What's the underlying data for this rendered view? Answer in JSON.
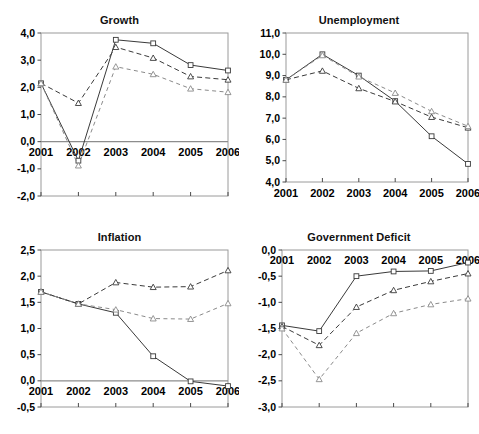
{
  "figure": {
    "panels": [
      "growth",
      "unemployment",
      "inflation",
      "deficit"
    ]
  },
  "chart_data": [
    {
      "id": "growth",
      "type": "line",
      "title": "Growth",
      "xlabel": "",
      "ylabel": "",
      "x": [
        "2001",
        "2002",
        "2003",
        "2004",
        "2005",
        "2006"
      ],
      "xticklabels": [
        "2001",
        "2002",
        "2003",
        "2004",
        "2005",
        "2006"
      ],
      "yticklabels": [
        "4,0",
        "3,0",
        "2,0",
        "1,0",
        "0,0",
        "-1,0",
        "-2,0"
      ],
      "yticks": [
        4.0,
        3.0,
        2.0,
        1.0,
        0.0,
        -1.0,
        -2.0
      ],
      "ylim": [
        -2.0,
        4.0
      ],
      "grid": false,
      "legend": "none",
      "zero_line": true,
      "series": [
        {
          "name": "series-1",
          "style": "solid",
          "marker": "square",
          "values": [
            2.15,
            -0.7,
            3.75,
            3.62,
            2.82,
            2.62
          ]
        },
        {
          "name": "series-2",
          "style": "dashed",
          "marker": "triangle",
          "values": [
            2.15,
            1.42,
            3.48,
            3.08,
            2.4,
            2.28
          ]
        },
        {
          "name": "series-3",
          "style": "dashed-light",
          "marker": "triangle",
          "values": [
            2.15,
            -0.88,
            2.76,
            2.48,
            1.95,
            1.82
          ]
        }
      ]
    },
    {
      "id": "unemployment",
      "type": "line",
      "title": "Unemployment",
      "xlabel": "",
      "ylabel": "",
      "x": [
        "2001",
        "2002",
        "2003",
        "2004",
        "2005",
        "2006"
      ],
      "xticklabels": [
        "2001",
        "2002",
        "2003",
        "2004",
        "2005",
        "2006"
      ],
      "yticklabels": [
        "11,0",
        "10,0",
        "9,0",
        "8,0",
        "7,0",
        "6,0",
        "5,0",
        "4,0"
      ],
      "yticks": [
        11.0,
        10.0,
        9.0,
        8.0,
        7.0,
        6.0,
        5.0,
        4.0
      ],
      "ylim": [
        4.0,
        11.0
      ],
      "grid": false,
      "legend": "none",
      "zero_line": false,
      "series": [
        {
          "name": "series-1",
          "style": "solid",
          "marker": "square",
          "values": [
            8.8,
            10.0,
            9.0,
            7.8,
            6.15,
            4.85
          ]
        },
        {
          "name": "series-2",
          "style": "dashed",
          "marker": "triangle",
          "values": [
            8.8,
            9.22,
            8.4,
            7.78,
            7.05,
            6.55
          ]
        },
        {
          "name": "series-3",
          "style": "dashed-light",
          "marker": "triangle",
          "values": [
            8.8,
            9.95,
            8.95,
            8.18,
            7.32,
            6.62
          ]
        }
      ]
    },
    {
      "id": "inflation",
      "type": "line",
      "title": "Inflation",
      "xlabel": "",
      "ylabel": "",
      "x": [
        "2001",
        "2002",
        "2003",
        "2004",
        "2005",
        "2006"
      ],
      "xticklabels": [
        "2001",
        "2002",
        "2003",
        "2004",
        "2005",
        "2006"
      ],
      "yticklabels": [
        "2,5",
        "2,0",
        "1,5",
        "1,0",
        "0,5",
        "0,0",
        "-0,5"
      ],
      "yticks": [
        2.5,
        2.0,
        1.5,
        1.0,
        0.5,
        0.0,
        -0.5
      ],
      "ylim": [
        -0.5,
        2.5
      ],
      "grid": false,
      "legend": "none",
      "zero_line": true,
      "series": [
        {
          "name": "series-1",
          "style": "solid",
          "marker": "square",
          "values": [
            1.7,
            1.47,
            1.3,
            0.47,
            -0.01,
            -0.1
          ]
        },
        {
          "name": "series-2",
          "style": "dashed",
          "marker": "triangle",
          "values": [
            1.7,
            1.47,
            1.88,
            1.79,
            1.8,
            2.11
          ]
        },
        {
          "name": "series-3",
          "style": "dashed-light",
          "marker": "triangle",
          "values": [
            1.7,
            1.47,
            1.36,
            1.19,
            1.18,
            1.48
          ]
        }
      ]
    },
    {
      "id": "deficit",
      "type": "line",
      "title": "Government Deficit",
      "xlabel": "",
      "ylabel": "",
      "x": [
        "2001",
        "2002",
        "2003",
        "2004",
        "2005",
        "2006"
      ],
      "xticklabels": [
        "2001",
        "2002",
        "2003",
        "2004",
        "2005",
        "2006"
      ],
      "yticklabels": [
        "0,0",
        "-0,5",
        "-1,0",
        "-1,5",
        "-2,0",
        "-2,5",
        "-3,0"
      ],
      "yticks": [
        0.0,
        -0.5,
        -1.0,
        -1.5,
        -2.0,
        -2.5,
        -3.0
      ],
      "ylim": [
        -3.0,
        0.0
      ],
      "grid": false,
      "legend": "none",
      "zero_line": false,
      "series": [
        {
          "name": "series-1",
          "style": "solid",
          "marker": "square",
          "values": [
            -1.44,
            -1.55,
            -0.5,
            -0.41,
            -0.4,
            -0.24
          ]
        },
        {
          "name": "series-2",
          "style": "dashed",
          "marker": "triangle",
          "values": [
            -1.46,
            -1.82,
            -1.09,
            -0.77,
            -0.6,
            -0.45
          ]
        },
        {
          "name": "series-3",
          "style": "dashed-light",
          "marker": "triangle",
          "values": [
            -1.5,
            -2.47,
            -1.59,
            -1.21,
            -1.04,
            -0.93
          ]
        }
      ]
    }
  ]
}
